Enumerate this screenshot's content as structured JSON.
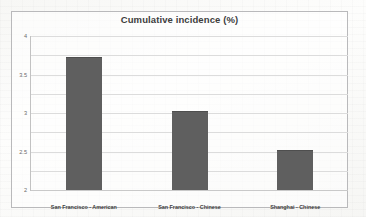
{
  "chart_data": {
    "type": "bar",
    "title": "Cumulative incidence (%)",
    "xlabel": "",
    "ylabel": "",
    "categories": [
      "San Francisco - American",
      "San Francisco - Chinese",
      "Shanghai - Chinese"
    ],
    "values": [
      3.45,
      2.05,
      1.05
    ],
    "ylim": [
      0,
      4
    ],
    "ytick_labels": [
      "0",
      "0.5",
      "1",
      "1.5",
      "2",
      "2.5",
      "3",
      "3.5",
      "4"
    ],
    "ytick_values": [
      0,
      0.5,
      1,
      1.5,
      2,
      2.5,
      3,
      3.5,
      4
    ],
    "grid": true,
    "legend": false,
    "bar_color": "#5f5f5f",
    "gridline_color": "#dcdcdc",
    "title_color": "#3d3d3d",
    "border_color": "#b9b9bb"
  }
}
